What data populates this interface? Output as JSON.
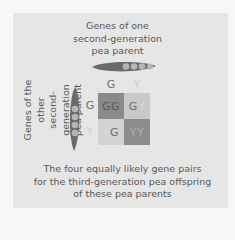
{
  "title": {
    "lines": [
      "Genes of one",
      "second-generation",
      "pea parent"
    ]
  },
  "side_label": {
    "lines": [
      "Genes of the other",
      "second-generation",
      "pea parent"
    ]
  },
  "caption": {
    "lines": [
      "The four equally likely gene pairs",
      "for the third-generation pea offspring",
      "of these pea parents"
    ]
  },
  "punnett": {
    "column_headers": [
      "G",
      "Y"
    ],
    "row_headers": [
      "G",
      "Y"
    ],
    "cells": [
      [
        {
          "a": "G",
          "b": "G",
          "color": "#8a8a8a"
        },
        {
          "a": "G",
          "b": "Y",
          "color": "#c9c9c9"
        }
      ],
      [
        {
          "a": "Y",
          "b": "G",
          "color": "#d2d2d2"
        },
        {
          "a": "Y",
          "b": "Y",
          "color": "#8c8c8c"
        }
      ]
    ]
  },
  "colors": {
    "background": "#f7f7f7",
    "panel": "#e6e6e6",
    "pod": "#6a6a6a",
    "pea": "#b5b5b5",
    "dominant_text": "#6e6e6e",
    "recessive_text": "#cfcfcf"
  }
}
